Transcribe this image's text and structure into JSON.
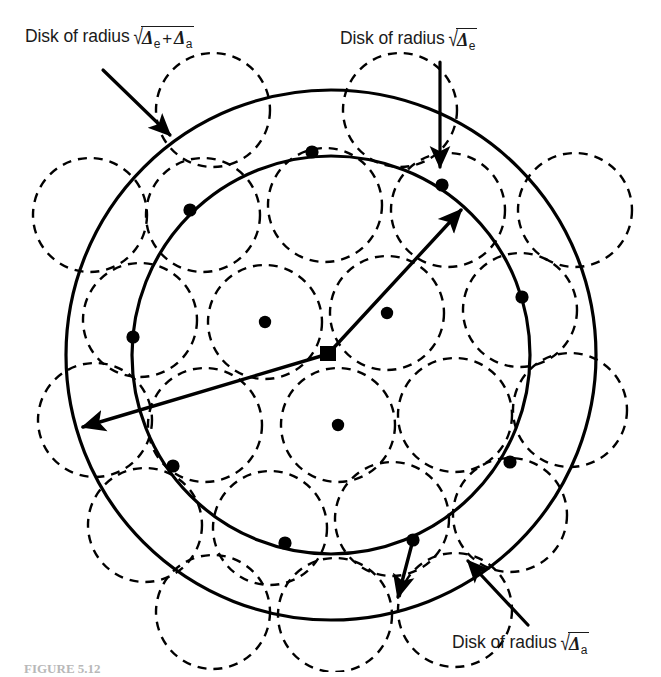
{
  "figure": {
    "caption": "FIGURE 5.12",
    "background_color": "#ffffff",
    "ink_color": "#000000"
  },
  "labels": {
    "outer": {
      "text": "Disk of radius",
      "radical": "√",
      "sym1": "Δ",
      "sub1": "e",
      "plus": "+",
      "sym2": "Δ",
      "sub2": "a"
    },
    "inner": {
      "text": "Disk of radius",
      "radical": "√",
      "sym1": "Δ",
      "sub1": "e"
    },
    "dashed": {
      "text": "Disk of radius",
      "radical": "√",
      "sym1": "Δ",
      "sub1": "a"
    }
  },
  "chart_data": {
    "type": "diagram",
    "center": {
      "x": 328,
      "y": 354
    },
    "circles": {
      "outer": {
        "cx": 331,
        "cy": 355,
        "r": 265,
        "style": "solid",
        "stroke_width": 3.2
      },
      "inner": {
        "cx": 331,
        "cy": 355,
        "r": 199,
        "style": "solid",
        "stroke_width": 3.2
      },
      "dashed_radius": 57
    },
    "dashed_centers": [
      {
        "x": 265,
        "y": 322
      },
      {
        "x": 387,
        "y": 313
      },
      {
        "x": 338,
        "y": 425
      },
      {
        "x": 205,
        "y": 425
      },
      {
        "x": 270,
        "y": 528
      },
      {
        "x": 392,
        "y": 519
      },
      {
        "x": 455,
        "y": 415
      },
      {
        "x": 448,
        "y": 210
      },
      {
        "x": 325,
        "y": 205
      },
      {
        "x": 203,
        "y": 215
      },
      {
        "x": 140,
        "y": 320
      },
      {
        "x": 145,
        "y": 525
      },
      {
        "x": 335,
        "y": 615
      },
      {
        "x": 510,
        "y": 515
      },
      {
        "x": 520,
        "y": 310
      },
      {
        "x": 400,
        "y": 110
      },
      {
        "x": 213,
        "y": 110
      },
      {
        "x": 95,
        "y": 420
      },
      {
        "x": 455,
        "y": 610
      },
      {
        "x": 570,
        "y": 410
      },
      {
        "x": 575,
        "y": 210
      },
      {
        "x": 90,
        "y": 215
      },
      {
        "x": 213,
        "y": 612
      }
    ],
    "inner_dots": [
      {
        "x": 265,
        "y": 322
      },
      {
        "x": 387,
        "y": 313
      },
      {
        "x": 338,
        "y": 425
      }
    ],
    "boundary_dots": [
      {
        "x": 312,
        "y": 152
      },
      {
        "x": 190,
        "y": 210
      },
      {
        "x": 133,
        "y": 337
      },
      {
        "x": 173,
        "y": 466
      },
      {
        "x": 285,
        "y": 543
      },
      {
        "x": 413,
        "y": 540
      },
      {
        "x": 510,
        "y": 462
      },
      {
        "x": 522,
        "y": 297
      },
      {
        "x": 442,
        "y": 185
      }
    ],
    "arrows": [
      {
        "name": "outer-radius-arrow",
        "from": {
          "x": 328,
          "y": 354
        },
        "to": {
          "x": 83,
          "y": 427
        }
      },
      {
        "name": "inner-radius-arrow",
        "from": {
          "x": 328,
          "y": 354
        },
        "to": {
          "x": 461,
          "y": 210
        }
      },
      {
        "name": "dashed-radius-arrow",
        "from": {
          "x": 413,
          "y": 540
        },
        "to": {
          "x": 398,
          "y": 597
        }
      }
    ],
    "leaders": [
      {
        "name": "outer-label-leader",
        "from": {
          "x": 103,
          "y": 70
        },
        "to": {
          "x": 170,
          "y": 135
        }
      },
      {
        "name": "inner-label-leader",
        "from": {
          "x": 440,
          "y": 62
        },
        "to": {
          "x": 440,
          "y": 167
        }
      },
      {
        "name": "dashed-label-leader",
        "from": {
          "x": 528,
          "y": 625
        },
        "to": {
          "x": 468,
          "y": 561
        }
      }
    ]
  }
}
